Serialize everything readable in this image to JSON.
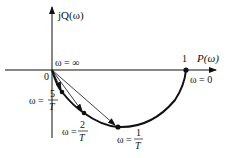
{
  "diagram": {
    "type": "nyquist-plot",
    "axes": {
      "x_label": "P(ω)",
      "y_label": "jQ(ω)",
      "origin_label": "0"
    },
    "points": [
      {
        "id": "infinity",
        "label": "ω = ∞"
      },
      {
        "id": "one",
        "tick_label": "1",
        "label": "ω = 0"
      },
      {
        "id": "five_over_T",
        "label_prefix": "ω =",
        "numerator": "5",
        "denominator": "T"
      },
      {
        "id": "two_over_T",
        "label_prefix": "ω =",
        "numerator": "2",
        "denominator": "T"
      },
      {
        "id": "one_over_T",
        "label_prefix": "ω =",
        "numerator": "1",
        "denominator": "T"
      }
    ],
    "colors": {
      "stroke": "#111111",
      "background": "#ffffff"
    }
  }
}
